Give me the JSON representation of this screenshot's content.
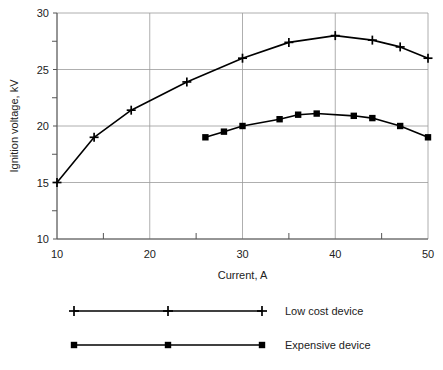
{
  "chart_data": {
    "type": "line",
    "title": "",
    "xlabel": "Current, A",
    "ylabel": "Ignition voltage, kV",
    "xlim": [
      10,
      50
    ],
    "ylim": [
      10,
      30
    ],
    "x_major_ticks": [
      10,
      20,
      30,
      40,
      50
    ],
    "x_minor_ticks": [
      15,
      25,
      35,
      45
    ],
    "y_major_ticks": [
      10,
      15,
      20,
      25,
      30
    ],
    "y_minor_ticks": [
      12.5,
      17.5,
      22.5,
      27.5
    ],
    "x_tick_labels": [
      "10",
      "20",
      "30",
      "40",
      "50"
    ],
    "y_tick_labels": [
      "10",
      "15",
      "20",
      "25",
      "30"
    ],
    "grid": true,
    "legend_position": "below",
    "series": [
      {
        "name": "Low cost device",
        "marker": "plus",
        "color": "#000000",
        "points": [
          [
            10,
            15.0
          ],
          [
            14,
            19.0
          ],
          [
            18,
            21.4
          ],
          [
            24,
            23.9
          ],
          [
            30,
            26.0
          ],
          [
            35,
            27.4
          ],
          [
            40,
            28.0
          ],
          [
            44,
            27.6
          ],
          [
            47,
            27.0
          ],
          [
            50,
            26.0
          ]
        ]
      },
      {
        "name": "Expensive device",
        "marker": "square",
        "color": "#000000",
        "points": [
          [
            26,
            19.0
          ],
          [
            28,
            19.5
          ],
          [
            30,
            20.0
          ],
          [
            34,
            20.6
          ],
          [
            36,
            21.0
          ],
          [
            38,
            21.1
          ],
          [
            42,
            20.9
          ],
          [
            44,
            20.7
          ],
          [
            47,
            20.0
          ],
          [
            50,
            19.0
          ]
        ]
      }
    ]
  },
  "legend": {
    "entries": [
      {
        "label": "Low cost device",
        "marker": "plus-icon"
      },
      {
        "label": "Expensive device",
        "marker": "square-icon"
      }
    ]
  },
  "axes": {
    "x_title": "Current, A",
    "y_title": "Ignition voltage, kV"
  }
}
